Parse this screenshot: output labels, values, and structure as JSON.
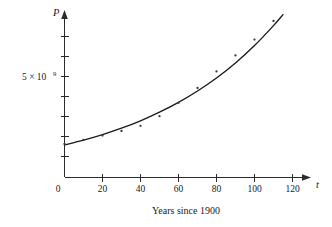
{
  "chart_data": {
    "type": "scatter",
    "title": "",
    "subtitle": "",
    "caption": "Years since 1900",
    "xlabel": "t",
    "ylabel": "P",
    "xlim": [
      0,
      128
    ],
    "ylim": [
      0,
      9200000000
    ],
    "grid": false,
    "legend": null,
    "x_ticks": [
      {
        "value": 0,
        "label": "0"
      },
      {
        "value": 20,
        "label": "20"
      },
      {
        "value": 40,
        "label": "40"
      },
      {
        "value": 60,
        "label": "60"
      },
      {
        "value": 80,
        "label": "80"
      },
      {
        "value": 100,
        "label": "100"
      },
      {
        "value": 120,
        "label": "120"
      }
    ],
    "y_ticks": [
      {
        "value": 1000000000,
        "label": ""
      },
      {
        "value": 2000000000,
        "label": ""
      },
      {
        "value": 3000000000,
        "label": ""
      },
      {
        "value": 4000000000,
        "label": ""
      },
      {
        "value": 5000000000,
        "label": "5 × 10⁹"
      },
      {
        "value": 6000000000,
        "label": ""
      },
      {
        "value": 7000000000,
        "label": ""
      },
      {
        "value": 8000000000,
        "label": ""
      }
    ],
    "y_axis_label_mantissa": "5 × 10",
    "y_axis_label_exponent": "9",
    "series": [
      {
        "name": "data points",
        "type": "scatter",
        "marker": "dot",
        "x": [
          0,
          10,
          20,
          30,
          40,
          50,
          60,
          70,
          80,
          90,
          100,
          110
        ],
        "y": [
          1650000000,
          1860000000,
          2070000000,
          2300000000,
          2560000000,
          3040000000,
          3710000000,
          4450000000,
          5280000000,
          6080000000,
          6870000000,
          7800000000
        ]
      },
      {
        "name": "exponential model",
        "type": "line",
        "x": [
          0,
          10,
          20,
          30,
          40,
          50,
          60,
          70,
          80,
          90,
          100,
          110,
          115
        ],
        "y": [
          1600000000,
          1840000000,
          2120000000,
          2440000000,
          2810000000,
          3240000000,
          3730000000,
          4300000000,
          4950000000,
          5700000000,
          6570000000,
          7570000000,
          8120000000
        ]
      }
    ]
  },
  "figure": {
    "axis_arrow_x_name": "x-axis-arrow",
    "axis_arrow_y_name": "y-axis-arrow"
  }
}
